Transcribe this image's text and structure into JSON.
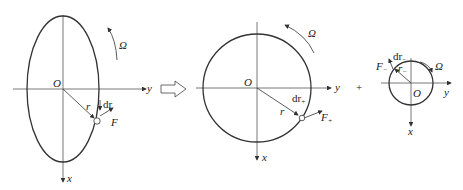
{
  "diagram": {
    "title": "",
    "operators": {
      "arrow": "double-arrow-right",
      "plus": "+"
    },
    "panels": [
      {
        "name": "ellipse-orbit",
        "shape": "ellipse",
        "labels": {
          "origin": "O",
          "x_axis": "x",
          "y_axis": "y",
          "rotation": "Ω",
          "radius": "r",
          "dr": "dr",
          "force": "F"
        }
      },
      {
        "name": "circle-orbit-plus",
        "shape": "circle",
        "labels": {
          "origin": "O",
          "x_axis": "x",
          "y_axis": "y",
          "rotation": "Ω",
          "radius": "r",
          "dr": "dr",
          "dr_sub": "+",
          "force": "F",
          "force_sub": "+"
        }
      },
      {
        "name": "circle-orbit-minus",
        "shape": "small-circle",
        "labels": {
          "origin": "O",
          "x_axis": "x",
          "y_axis": "y",
          "rotation": "Ω",
          "radius": "r",
          "radius_sub": "−",
          "dr": "dr",
          "dr_sub": "−",
          "force": "F",
          "force_sub": "−"
        }
      }
    ]
  }
}
